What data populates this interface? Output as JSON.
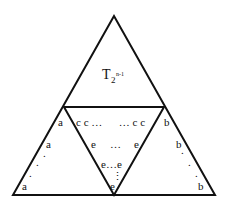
{
  "diagram": {
    "title": {
      "main": "T",
      "subscript": "2",
      "superscript": "n-1"
    },
    "colors": {
      "stroke": "#111111",
      "background": "#ffffff"
    },
    "labels": {
      "left_triangle": [
        "a",
        "a",
        "a"
      ],
      "left_dots": ".",
      "right_triangle": [
        "b",
        "b",
        "b"
      ],
      "right_dots": ".",
      "middle_top_row": "c c …      … c c",
      "middle_second_row_left": "e",
      "middle_second_row_dots": "…",
      "middle_second_row_right": "e",
      "middle_third_row": "e…e",
      "middle_bottom": "e",
      "vertical_dots": "⋮"
    }
  }
}
